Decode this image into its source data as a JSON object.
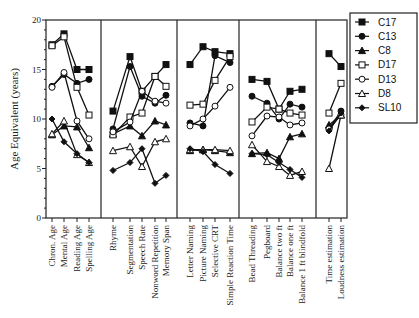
{
  "chart_data": {
    "type": "line",
    "title": "",
    "xlabel": "",
    "ylabel": "Age Equivalent (years)",
    "ylim": [
      0,
      20
    ],
    "yticks": [
      0,
      5,
      10,
      15,
      20
    ],
    "grid": false,
    "legend_position": "right",
    "panels": [
      {
        "categories": [
          "Chron. Age",
          "Mental Age",
          "Reading Age",
          "Spelling Age"
        ]
      },
      {
        "categories": [
          "Rhyme",
          "Segmentation",
          "Speech Rate",
          "Nonword Repetition",
          "Memory Span"
        ]
      },
      {
        "categories": [
          "Letter Naming",
          "Picture Naming",
          "Selective CRT",
          "Simple Reaction Time"
        ]
      },
      {
        "categories": [
          "Bead Threading",
          "Pegboard",
          "Balance two ft",
          "Balance one ft",
          "Balance 1 ft blindfold"
        ]
      },
      {
        "categories": [
          "Time estimation",
          "Loudness estimation"
        ]
      }
    ],
    "series": [
      {
        "name": "C17",
        "marker": "filled-square",
        "values": [
          [
            17.5,
            18.6,
            15.0,
            15.0
          ],
          [
            10.8,
            16.3,
            12.8,
            14.3,
            15.5
          ],
          [
            15.5,
            17.3,
            16.8,
            16.6
          ],
          [
            14.0,
            13.8,
            11.0,
            12.8,
            13.0
          ],
          [
            16.6,
            15.3
          ]
        ]
      },
      {
        "name": "C13",
        "marker": "filled-circle",
        "values": [
          [
            13.3,
            14.5,
            13.6,
            14.0
          ],
          [
            9.0,
            15.3,
            12.3,
            11.6,
            12.4
          ],
          [
            9.6,
            9.3,
            16.4,
            15.7
          ],
          [
            12.3,
            11.6,
            10.0,
            11.5,
            11.2
          ],
          [
            9.0,
            10.8
          ]
        ]
      },
      {
        "name": "C8",
        "marker": "filled-triangle",
        "values": [
          [
            8.4,
            9.3,
            9.2,
            7.1
          ],
          [
            8.5,
            9.3,
            8.3,
            9.8,
            9.4
          ],
          [
            6.8,
            6.9,
            6.8,
            6.6
          ],
          [
            6.5,
            6.6,
            6.0,
            8.2,
            8.5
          ],
          [
            9.4,
            10.4
          ]
        ]
      },
      {
        "name": "D17",
        "marker": "open-square",
        "values": [
          [
            17.4,
            18.3,
            13.2,
            10.4
          ],
          [
            8.4,
            10.2,
            10.6,
            14.3,
            13.3
          ],
          [
            11.4,
            11.5,
            13.9,
            16.3
          ],
          [
            9.7,
            11.2,
            11.0,
            10.6,
            10.4
          ],
          [
            10.6,
            13.6
          ]
        ]
      },
      {
        "name": "D13",
        "marker": "open-circle",
        "values": [
          [
            13.2,
            14.7,
            9.8,
            8.0
          ],
          [
            8.7,
            9.7,
            12.8,
            11.8,
            11.6
          ],
          [
            9.3,
            10.0,
            11.3,
            13.2
          ],
          [
            8.3,
            10.3,
            10.2,
            9.4,
            9.6
          ],
          [
            9.0,
            10.4
          ]
        ]
      },
      {
        "name": "D8",
        "marker": "open-triangle",
        "values": [
          [
            8.5,
            9.8,
            6.4,
            5.6
          ],
          [
            6.8,
            7.2,
            5.2,
            7.7,
            8.0
          ],
          [
            6.9,
            6.9,
            6.9,
            6.8
          ],
          [
            7.4,
            5.7,
            5.2,
            4.3,
            4.7
          ],
          [
            5.0,
            10.4
          ]
        ]
      },
      {
        "name": "SL10",
        "marker": "filled-diamond",
        "values": [
          [
            10.0,
            7.7,
            6.5,
            5.6
          ],
          [
            4.8,
            5.6,
            7.0,
            3.5,
            4.3
          ],
          [
            7.0,
            6.7,
            5.4,
            4.5
          ],
          [
            6.5,
            6.4,
            5.6,
            4.9,
            4.1
          ],
          [
            8.8,
            10.6
          ]
        ]
      }
    ]
  },
  "axis": {
    "ylabel": "Age Equivalent (years)",
    "yticks": [
      "0",
      "5",
      "10",
      "15",
      "20"
    ]
  },
  "legend": {
    "items": [
      "C17",
      "C13",
      "C8",
      "D17",
      "D13",
      "D8",
      "SL10"
    ]
  }
}
